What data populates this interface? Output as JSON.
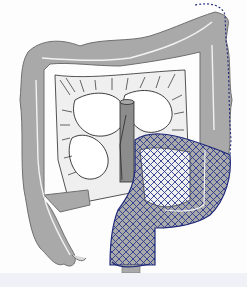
{
  "figure": {
    "type": "anatomical-illustration",
    "labels": [],
    "colors": {
      "background": "#fdfdfd",
      "colon_fill": "#a9a9a9",
      "colon_outline": "#6f6f6f",
      "lumen_line": "#f2f2f2",
      "small_intestine_fill": "#ffffff",
      "small_intestine_outline": "#2a2a2a",
      "mesentery_fill": "#efefef",
      "vessel_fill": "#8c8c8c",
      "highlight_outline": "#1f2a7a",
      "hatch": "#2b3a8f",
      "bottom_band": "#eef2f6"
    },
    "regions": [
      {
        "name": "ascending-colon",
        "highlighted": false
      },
      {
        "name": "transverse-colon",
        "highlighted": false
      },
      {
        "name": "splenic-flexure",
        "highlighted": "dashed-outline"
      },
      {
        "name": "descending-colon",
        "highlighted": "cross-hatched"
      },
      {
        "name": "sigmoid-colon",
        "highlighted": "cross-hatched"
      },
      {
        "name": "rectum",
        "highlighted": "cross-hatched"
      },
      {
        "name": "cecum-appendix",
        "highlighted": false
      },
      {
        "name": "small-intestine",
        "highlighted": false
      },
      {
        "name": "mesenteric-vessel",
        "highlighted": false
      }
    ]
  }
}
